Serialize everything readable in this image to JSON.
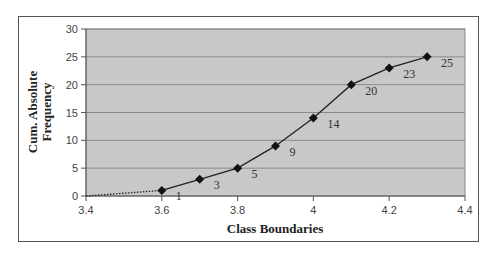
{
  "chart_data": {
    "type": "line",
    "title": "",
    "xlabel": "Class Boundaries",
    "ylabel_lines": [
      "Cum. Absolute",
      "Frequency"
    ],
    "ylabel": "Cum. Absolute Frequency",
    "xlim": [
      3.4,
      4.4
    ],
    "ylim": [
      0,
      30
    ],
    "x_ticks": [
      "3.4",
      "3.6",
      "3.8",
      "4",
      "4.2",
      "4.4"
    ],
    "y_ticks": [
      "0",
      "5",
      "10",
      "15",
      "20",
      "25",
      "30"
    ],
    "grid": "horizontal",
    "legend": "none",
    "series": [
      {
        "name": "Cumulative frequency",
        "x": [
          3.6,
          3.7,
          3.8,
          3.9,
          4.0,
          4.1,
          4.2,
          4.3
        ],
        "values": [
          1,
          3,
          5,
          9,
          14,
          20,
          23,
          25
        ],
        "labels": [
          "1",
          "3",
          "5",
          "9",
          "14",
          "20",
          "23",
          "25"
        ],
        "marker": "diamond",
        "line": "solid"
      },
      {
        "name": "Extension to origin",
        "x": [
          3.4,
          3.6
        ],
        "values": [
          0,
          1
        ],
        "line": "dotted"
      }
    ],
    "colors": {
      "plot_bg": "#c8c8c8",
      "line": "#222222",
      "grid": "#8a8a8a"
    }
  }
}
